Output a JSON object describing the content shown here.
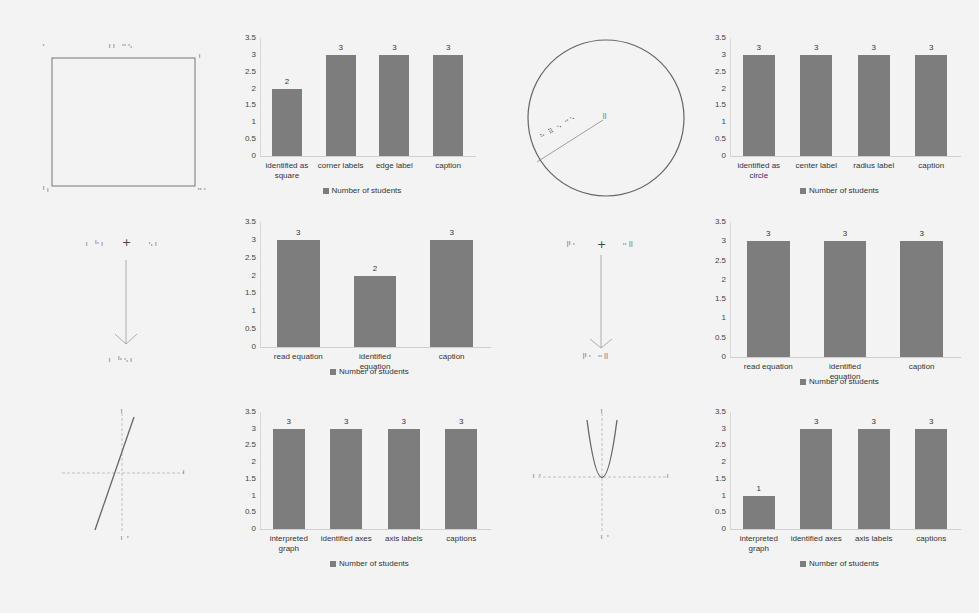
{
  "figures": {
    "square": {
      "label": "tactile square graphic",
      "braille_marks": [
        "⠁",
        "⠰⠆ ⠒⠢",
        "⠆",
        "⠘⠆",
        "⠒⠂"
      ]
    },
    "circle": {
      "label": "tactile circle graphic",
      "braille_marks": [
        "⠓ ⠿ ⠢ ⠒⠢",
        "⠿"
      ]
    },
    "equation_left": {
      "label": "tactile equation graphic",
      "braille_marks": [
        "⠆ ⠓⠆",
        "+",
        "⠢⠆",
        "⠆ ⠓⠢⠆"
      ]
    },
    "equation_right": {
      "label": "tactile equation graphic",
      "braille_marks": [
        "⠟⠂",
        "+",
        "⠒⠿",
        "⠟⠂ ⠒⠿"
      ]
    },
    "line_graph": {
      "label": "tactile linear graph",
      "axis_marks": [
        "⠆",
        "⠆",
        "⠆⠂"
      ]
    },
    "parabola_graph": {
      "label": "tactile parabola graph",
      "axis_marks": [
        "⠆",
        "⠆⠂",
        "⠆",
        "⠆⠂"
      ]
    }
  },
  "chart_data": [
    {
      "type": "bar",
      "title": "",
      "xlabel": "",
      "ylabel": "",
      "yticks": [
        "3.5",
        "3",
        "2.5",
        "2",
        "1.5",
        "1",
        "0.5",
        "0"
      ],
      "ylim": [
        0,
        3.5
      ],
      "categories": [
        "identified as square",
        "corner labels",
        "edge label",
        "caption"
      ],
      "series": [
        {
          "name": "Number of students",
          "values": [
            2,
            3,
            3,
            3
          ]
        }
      ],
      "legend": "Number of students",
      "legend_position": "bottom",
      "grid": false
    },
    {
      "type": "bar",
      "title": "",
      "xlabel": "",
      "ylabel": "",
      "yticks": [
        "3.5",
        "3",
        "2.5",
        "2",
        "1.5",
        "1",
        "0.5",
        "0"
      ],
      "ylim": [
        0,
        3.5
      ],
      "categories": [
        "identified as circle",
        "center label",
        "radius label",
        "caption"
      ],
      "series": [
        {
          "name": "Number of students",
          "values": [
            3,
            3,
            3,
            3
          ]
        }
      ],
      "legend": "Number of students",
      "legend_position": "bottom",
      "grid": false
    },
    {
      "type": "bar",
      "title": "",
      "xlabel": "",
      "ylabel": "",
      "yticks": [
        "3.5",
        "3",
        "2.5",
        "2",
        "1.5",
        "1",
        "0.5",
        "0"
      ],
      "ylim": [
        0,
        3.5
      ],
      "categories": [
        "read equation",
        "identified equation",
        "caption"
      ],
      "series": [
        {
          "name": "Number of students",
          "values": [
            3,
            2,
            3
          ]
        }
      ],
      "legend": "Number of students",
      "legend_position": "bottom",
      "grid": false
    },
    {
      "type": "bar",
      "title": "",
      "xlabel": "",
      "ylabel": "",
      "yticks": [
        "3.5",
        "3",
        "2.5",
        "2",
        "1.5",
        "1",
        "0.5",
        "0"
      ],
      "ylim": [
        0,
        3.5
      ],
      "categories": [
        "read equation",
        "identified equation",
        "caption"
      ],
      "series": [
        {
          "name": "Number of students",
          "values": [
            3,
            3,
            3
          ]
        }
      ],
      "legend": "Number of students",
      "legend_position": "bottom",
      "grid": false
    },
    {
      "type": "bar",
      "title": "",
      "xlabel": "",
      "ylabel": "",
      "yticks": [
        "3.5",
        "3",
        "2.5",
        "2",
        "1.5",
        "1",
        "0.5",
        "0"
      ],
      "ylim": [
        0,
        3.5
      ],
      "categories": [
        "interpreted graph",
        "identified axes",
        "axis labels",
        "captions"
      ],
      "series": [
        {
          "name": "Number of students",
          "values": [
            3,
            3,
            3,
            3
          ]
        }
      ],
      "legend": "Number of students",
      "legend_position": "bottom",
      "grid": false
    },
    {
      "type": "bar",
      "title": "",
      "xlabel": "",
      "ylabel": "",
      "yticks": [
        "3.5",
        "3",
        "2.5",
        "2",
        "1.5",
        "1",
        "0.5",
        "0"
      ],
      "ylim": [
        0,
        3.5
      ],
      "categories": [
        "interpreted graph",
        "identified axes",
        "axis labels",
        "captions"
      ],
      "series": [
        {
          "name": "Number of students",
          "values": [
            1,
            3,
            3,
            3
          ]
        }
      ],
      "legend": "Number of students",
      "legend_position": "bottom",
      "grid": false
    }
  ],
  "colors": {
    "bar": "#7d7d7d",
    "background": "#f3f3f3",
    "figure_line": "#555555"
  }
}
